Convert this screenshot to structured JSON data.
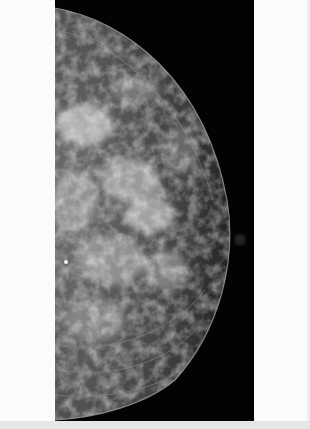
{
  "image": {
    "description": "Mammogram (mediolateral/craniocaudal view) showing breast tissue with dense fibroglandular pattern on black background",
    "width": 310,
    "height": 429,
    "panel": {
      "left": 55,
      "top": 0,
      "width": 199,
      "height": 421
    },
    "colors": {
      "page_background": "#fbfbfb",
      "panel_background": "#030303",
      "tissue_light": "#d8d8d8",
      "tissue_dark": "#2a2a2a",
      "skin_line": "#9a9a9a",
      "bottom_strip": "#e6e6e6"
    },
    "features": {
      "skin_contour": "semicircular arc from top-left to bottom-left, apex near x=232,y=235",
      "nipple_marker": {
        "x": 240,
        "y": 240,
        "radius": 5
      },
      "bright_calcification": {
        "x": 66,
        "y": 262
      }
    }
  }
}
